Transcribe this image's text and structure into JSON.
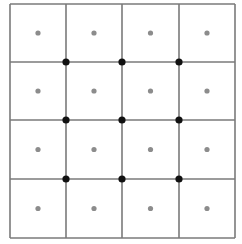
{
  "diagram": {
    "type": "grid-lattice",
    "rows": 4,
    "cols": 4,
    "x_lines": [
      10,
      66,
      122,
      179,
      235
    ],
    "y_lines": [
      4,
      62,
      120,
      179,
      238
    ],
    "colors": {
      "line": "#7a7a7a",
      "cell_dot": "#8c8c8c",
      "vertex_dot": "#111111",
      "background": "#ffffff"
    },
    "cell_center_dots": true,
    "interior_vertex_dots": true
  }
}
